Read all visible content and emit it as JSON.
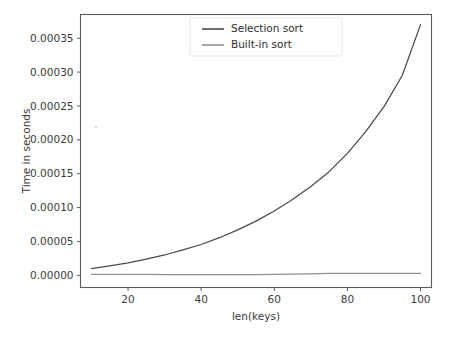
{
  "figure": {
    "background_color": "#ffffff",
    "axes_color": "#5a5a5a",
    "text_color": "#3b3b3b"
  },
  "axis": {
    "xlabel": "len(keys)",
    "ylabel": "Time in seconds",
    "x_ticks": [
      "20",
      "40",
      "60",
      "80",
      "100"
    ],
    "y_ticks": [
      "0.00000",
      "0.00005",
      "0.00010",
      "0.00015",
      "0.00020",
      "0.00025",
      "0.00030",
      "0.00035"
    ]
  },
  "legend": {
    "entries": [
      {
        "label": "Selection sort",
        "color": "#4a4a4a"
      },
      {
        "label": "Built-in sort",
        "color": "#8f8f8f"
      }
    ]
  },
  "chart_data": {
    "type": "line",
    "title": "",
    "xlabel": "len(keys)",
    "ylabel": "Time in seconds",
    "xlim": [
      7,
      103
    ],
    "ylim": [
      -1.8e-05,
      0.000385
    ],
    "x_ticks": [
      20,
      40,
      60,
      80,
      100
    ],
    "y_ticks": [
      0.0,
      5e-05,
      0.0001,
      0.00015,
      0.0002,
      0.00025,
      0.0003,
      0.00035
    ],
    "grid": false,
    "legend_position": "upper center",
    "x": [
      10,
      15,
      20,
      25,
      30,
      35,
      40,
      45,
      50,
      55,
      60,
      65,
      70,
      75,
      80,
      85,
      90,
      95,
      100
    ],
    "series": [
      {
        "name": "Selection sort",
        "color": "#4a4a4a",
        "values": [
          1e-05,
          1.4e-05,
          1.85e-05,
          2.4e-05,
          3e-05,
          3.75e-05,
          4.55e-05,
          5.55e-05,
          6.7e-05,
          8e-05,
          9.5e-05,
          0.000112,
          0.000131,
          0.000153,
          0.00018,
          0.000212,
          0.000249,
          0.000295,
          0.00037
        ]
      },
      {
        "name": "Built-in sort",
        "color": "#8f8f8f",
        "values": [
          1.3e-06,
          1.3e-06,
          1.2e-06,
          1.2e-06,
          1.1e-06,
          1.1e-06,
          1e-06,
          1e-06,
          1e-06,
          1.1e-06,
          1.3e-06,
          1.7e-06,
          2.2e-06,
          2.7e-06,
          2.8e-06,
          2.8e-06,
          2.8e-06,
          2.9e-06,
          2.9e-06
        ]
      }
    ]
  }
}
